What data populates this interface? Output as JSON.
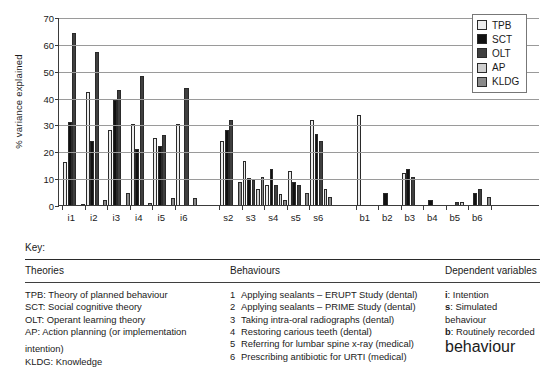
{
  "chart_data": {
    "type": "bar",
    "title": "",
    "xlabel": "",
    "ylabel": "% variance explained",
    "ylim": [
      0,
      70
    ],
    "yticks": [
      0,
      10,
      20,
      30,
      40,
      50,
      60,
      70
    ],
    "grid": true,
    "legend_position": "top-right",
    "categories": [
      "i1",
      "i2",
      "i3",
      "i4",
      "i5",
      "i6",
      "s2",
      "s3",
      "s4",
      "s5",
      "s6",
      "b1",
      "b2",
      "b3",
      "b4",
      "b5",
      "b6"
    ],
    "series": [
      {
        "name": "TPB",
        "color": "#ededed",
        "values": [
          16,
          42,
          28,
          30,
          25,
          30,
          24,
          16.5,
          7.5,
          12.5,
          31.5,
          33.5,
          0,
          12,
          0,
          0,
          0
        ]
      },
      {
        "name": "SCT",
        "color": "#111111",
        "values": [
          31,
          24,
          39,
          21,
          22,
          0,
          28,
          10,
          13.5,
          8.5,
          26.5,
          0,
          4.5,
          13.5,
          2,
          0,
          4.5
        ]
      },
      {
        "name": "OLT",
        "color": "#3f3f3f",
        "values": [
          64,
          57,
          43,
          48,
          26,
          43.5,
          31.5,
          9.5,
          7.5,
          7.5,
          24,
          0,
          0,
          10.5,
          0,
          1.2,
          6
        ]
      },
      {
        "name": "AP",
        "color": "#cfcfcf",
        "values": [
          0,
          0,
          0,
          0,
          0,
          0,
          0,
          6,
          4,
          0,
          6,
          0,
          0,
          0,
          0,
          1,
          0
        ]
      },
      {
        "name": "KLDG",
        "color": "#8a8a8a",
        "values": [
          0.5,
          2,
          4.5,
          0.7,
          2.5,
          2.5,
          8.5,
          10.5,
          2,
          4.5,
          3,
          0,
          0,
          0,
          0,
          0,
          3
        ]
      }
    ],
    "legend": [
      {
        "label": "TPB",
        "swatch": "#ededed"
      },
      {
        "label": "SCT",
        "swatch": "#111111"
      },
      {
        "label": "OLT",
        "swatch": "#3f3f3f"
      },
      {
        "label": "AP",
        "swatch": "#cfcfcf"
      },
      {
        "label": "KLDG",
        "swatch": "#8a8a8a"
      }
    ]
  },
  "key": {
    "title": "Key:",
    "columns": {
      "theories": {
        "heading": "Theories",
        "items": [
          {
            "text": "TPB: Theory of planned behaviour"
          },
          {
            "text": "SCT: Social cognitive theory"
          },
          {
            "text": "OLT: Operant learning theory"
          },
          {
            "text": "AP: Action planning (or implementation",
            "cont": "intention)"
          },
          {
            "text": "KLDG: Knowledge"
          }
        ]
      },
      "behaviours": {
        "heading": "Behaviours",
        "items": [
          {
            "n": "1",
            "text": "Applying sealants – ERUPT Study (dental)"
          },
          {
            "n": "2",
            "text": "Applying sealants – PRIME Study (dental)"
          },
          {
            "n": "3",
            "text": "Taking intra-oral radiographs (dental)"
          },
          {
            "n": "4",
            "text": "Restoring carious teeth (dental)"
          },
          {
            "n": "5",
            "text": "Referring for lumbar spine x-ray (medical)"
          },
          {
            "n": "6",
            "text": "Prescribing antibiotic for URTI (medical)"
          }
        ]
      },
      "dependent": {
        "heading": "Dependent variables",
        "items": [
          {
            "key": "i",
            "text": ": Intention",
            "cont": ""
          },
          {
            "key": "s",
            "text": ": Simulated behaviour",
            "cont": ""
          },
          {
            "key": "b",
            "text": ": Routinely recorded",
            "cont": "behaviour"
          }
        ]
      }
    }
  }
}
